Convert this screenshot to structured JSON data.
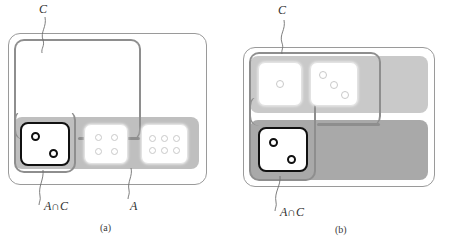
{
  "figure": {
    "caption_a": "(a)",
    "caption_b": "(b)",
    "colors": {
      "universe_border": "#9a9a9a",
      "c_border": "#8e8e8e",
      "band_light": "#c9c9c9",
      "band_dark": "#a9a9a9",
      "die_light_face": "#ffffff",
      "die_light_pip": "#c9c9c9",
      "die_dark_outline": "#111111",
      "leader_line": "#6f6f6f",
      "text": "#2e2e2e"
    }
  },
  "panel_a": {
    "label_c": "C",
    "label_a": "A",
    "label_a_inter_c": "A∩C",
    "caption": "(a)",
    "dice": [
      {
        "name": "die-two-highlighted",
        "pips": 2,
        "style": "dark",
        "region": "A∩C"
      },
      {
        "name": "die-four",
        "pips": 4,
        "style": "light",
        "region": "A"
      },
      {
        "name": "die-six",
        "pips": 6,
        "style": "light",
        "region": "A"
      }
    ]
  },
  "panel_b": {
    "label_c": "C",
    "label_a_inter_c": "A∩C",
    "caption": "(b)",
    "dice": [
      {
        "name": "die-one",
        "pips": 1,
        "style": "light",
        "region": "C"
      },
      {
        "name": "die-three",
        "pips": 3,
        "style": "light",
        "region": "C"
      },
      {
        "name": "die-two-highlighted",
        "pips": 2,
        "style": "dark",
        "region": "A∩C"
      }
    ]
  }
}
